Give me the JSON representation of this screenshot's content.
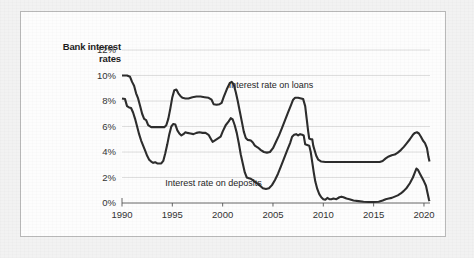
{
  "chart_data": {
    "type": "line",
    "title": "Bank interest rates",
    "title_lines": [
      "Bank interest",
      "rates"
    ],
    "xlabel": "",
    "ylabel": "",
    "xlim": [
      1990,
      2020.6
    ],
    "ylim": [
      0,
      12
    ],
    "grid": true,
    "legend_position": "inline-annotations",
    "x_ticks": [
      "1990",
      "1995",
      "2000",
      "2005",
      "2010",
      "2015",
      "2020"
    ],
    "x_tick_values": [
      1990,
      1995,
      2000,
      2005,
      2010,
      2015,
      2020
    ],
    "y_ticks": [
      "0%",
      "2%",
      "4%",
      "6%",
      "8%",
      "10%",
      "12%"
    ],
    "y_tick_values": [
      0,
      2,
      4,
      6,
      8,
      10,
      12
    ],
    "annotations": [
      {
        "text": "Interest rate on loans",
        "x": 2000.6,
        "y": 9.05
      },
      {
        "text": "Interest rate on deposits",
        "x": 1994.3,
        "y": 1.35
      }
    ],
    "series": [
      {
        "name": "Interest rate on loans",
        "color": "#2d2d2d",
        "points": [
          [
            1990.0,
            10.0
          ],
          [
            1990.5,
            10.0
          ],
          [
            1990.8,
            9.9
          ],
          [
            1991.0,
            9.5
          ],
          [
            1991.2,
            9.2
          ],
          [
            1991.4,
            8.6
          ],
          [
            1991.6,
            8.2
          ],
          [
            1991.8,
            7.6
          ],
          [
            1992.0,
            7.0
          ],
          [
            1992.2,
            6.6
          ],
          [
            1992.4,
            6.5
          ],
          [
            1992.6,
            6.1
          ],
          [
            1992.9,
            5.95
          ],
          [
            1993.4,
            5.95
          ],
          [
            1993.9,
            5.95
          ],
          [
            1994.2,
            5.95
          ],
          [
            1994.4,
            6.1
          ],
          [
            1994.6,
            6.6
          ],
          [
            1994.8,
            7.4
          ],
          [
            1995.0,
            8.3
          ],
          [
            1995.2,
            8.85
          ],
          [
            1995.4,
            8.9
          ],
          [
            1995.6,
            8.6
          ],
          [
            1995.8,
            8.4
          ],
          [
            1996.0,
            8.25
          ],
          [
            1996.3,
            8.2
          ],
          [
            1996.6,
            8.2
          ],
          [
            1997.0,
            8.3
          ],
          [
            1997.4,
            8.35
          ],
          [
            1997.8,
            8.35
          ],
          [
            1998.2,
            8.3
          ],
          [
            1998.6,
            8.25
          ],
          [
            1998.9,
            8.1
          ],
          [
            1999.1,
            7.75
          ],
          [
            1999.4,
            7.7
          ],
          [
            1999.7,
            7.75
          ],
          [
            1999.9,
            7.85
          ],
          [
            2000.1,
            8.3
          ],
          [
            2000.4,
            8.9
          ],
          [
            2000.7,
            9.4
          ],
          [
            2000.9,
            9.5
          ],
          [
            2001.1,
            9.3
          ],
          [
            2001.3,
            8.7
          ],
          [
            2001.5,
            8.0
          ],
          [
            2001.7,
            7.2
          ],
          [
            2001.9,
            6.4
          ],
          [
            2002.1,
            5.6
          ],
          [
            2002.3,
            5.1
          ],
          [
            2002.5,
            4.95
          ],
          [
            2002.8,
            4.9
          ],
          [
            2003.0,
            4.75
          ],
          [
            2003.2,
            4.5
          ],
          [
            2003.5,
            4.35
          ],
          [
            2003.8,
            4.15
          ],
          [
            2004.1,
            4.0
          ],
          [
            2004.4,
            3.95
          ],
          [
            2004.7,
            4.0
          ],
          [
            2005.0,
            4.3
          ],
          [
            2005.3,
            4.8
          ],
          [
            2005.6,
            5.3
          ],
          [
            2005.9,
            5.9
          ],
          [
            2006.2,
            6.5
          ],
          [
            2006.5,
            7.1
          ],
          [
            2006.8,
            7.7
          ],
          [
            2007.0,
            8.1
          ],
          [
            2007.2,
            8.25
          ],
          [
            2007.5,
            8.25
          ],
          [
            2007.8,
            8.2
          ],
          [
            2008.0,
            8.15
          ],
          [
            2008.2,
            7.6
          ],
          [
            2008.35,
            6.6
          ],
          [
            2008.5,
            5.6
          ],
          [
            2008.6,
            5.05
          ],
          [
            2008.75,
            5.0
          ],
          [
            2008.9,
            5.0
          ],
          [
            2009.0,
            4.5
          ],
          [
            2009.15,
            4.1
          ],
          [
            2009.3,
            3.7
          ],
          [
            2009.5,
            3.4
          ],
          [
            2009.8,
            3.25
          ],
          [
            2010.2,
            3.22
          ],
          [
            2011.0,
            3.22
          ],
          [
            2012.0,
            3.22
          ],
          [
            2013.0,
            3.22
          ],
          [
            2014.0,
            3.22
          ],
          [
            2015.0,
            3.22
          ],
          [
            2015.6,
            3.22
          ],
          [
            2015.9,
            3.3
          ],
          [
            2016.2,
            3.5
          ],
          [
            2016.5,
            3.65
          ],
          [
            2016.8,
            3.75
          ],
          [
            2017.1,
            3.8
          ],
          [
            2017.4,
            3.95
          ],
          [
            2017.7,
            4.15
          ],
          [
            2018.0,
            4.4
          ],
          [
            2018.3,
            4.7
          ],
          [
            2018.6,
            5.0
          ],
          [
            2018.9,
            5.35
          ],
          [
            2019.1,
            5.5
          ],
          [
            2019.3,
            5.55
          ],
          [
            2019.5,
            5.45
          ],
          [
            2019.7,
            5.2
          ],
          [
            2019.9,
            4.9
          ],
          [
            2020.1,
            4.7
          ],
          [
            2020.3,
            4.3
          ],
          [
            2020.45,
            3.6
          ],
          [
            2020.55,
            3.25
          ]
        ]
      },
      {
        "name": "Interest rate on deposits",
        "color": "#2d2d2d",
        "points": [
          [
            1990.0,
            8.2
          ],
          [
            1990.3,
            8.15
          ],
          [
            1990.5,
            7.6
          ],
          [
            1990.7,
            7.5
          ],
          [
            1990.9,
            7.45
          ],
          [
            1991.1,
            7.1
          ],
          [
            1991.3,
            6.6
          ],
          [
            1991.5,
            6.0
          ],
          [
            1991.7,
            5.4
          ],
          [
            1991.9,
            4.9
          ],
          [
            1992.1,
            4.5
          ],
          [
            1992.3,
            4.1
          ],
          [
            1992.5,
            3.7
          ],
          [
            1992.7,
            3.4
          ],
          [
            1992.9,
            3.25
          ],
          [
            1993.1,
            3.15
          ],
          [
            1993.3,
            3.2
          ],
          [
            1993.5,
            3.1
          ],
          [
            1993.7,
            3.1
          ],
          [
            1993.9,
            3.1
          ],
          [
            1994.1,
            3.3
          ],
          [
            1994.3,
            3.9
          ],
          [
            1994.5,
            4.6
          ],
          [
            1994.7,
            5.4
          ],
          [
            1994.9,
            6.0
          ],
          [
            1995.1,
            6.2
          ],
          [
            1995.3,
            6.15
          ],
          [
            1995.5,
            5.7
          ],
          [
            1995.7,
            5.45
          ],
          [
            1995.9,
            5.3
          ],
          [
            1996.1,
            5.4
          ],
          [
            1996.3,
            5.55
          ],
          [
            1996.5,
            5.5
          ],
          [
            1996.8,
            5.45
          ],
          [
            1997.1,
            5.4
          ],
          [
            1997.4,
            5.5
          ],
          [
            1997.7,
            5.55
          ],
          [
            1998.0,
            5.5
          ],
          [
            1998.3,
            5.5
          ],
          [
            1998.6,
            5.35
          ],
          [
            1998.85,
            5.0
          ],
          [
            1999.0,
            4.8
          ],
          [
            1999.2,
            4.9
          ],
          [
            1999.5,
            5.05
          ],
          [
            1999.8,
            5.2
          ],
          [
            2000.0,
            5.6
          ],
          [
            2000.3,
            6.1
          ],
          [
            2000.6,
            6.4
          ],
          [
            2000.8,
            6.65
          ],
          [
            2001.0,
            6.55
          ],
          [
            2001.2,
            6.1
          ],
          [
            2001.4,
            5.5
          ],
          [
            2001.6,
            4.7
          ],
          [
            2001.8,
            3.8
          ],
          [
            2002.0,
            3.1
          ],
          [
            2002.2,
            2.4
          ],
          [
            2002.4,
            2.0
          ],
          [
            2002.6,
            1.95
          ],
          [
            2002.8,
            1.9
          ],
          [
            2003.0,
            1.8
          ],
          [
            2003.2,
            1.65
          ],
          [
            2003.5,
            1.5
          ],
          [
            2003.8,
            1.3
          ],
          [
            2004.0,
            1.15
          ],
          [
            2004.3,
            1.1
          ],
          [
            2004.6,
            1.15
          ],
          [
            2004.9,
            1.4
          ],
          [
            2005.2,
            1.8
          ],
          [
            2005.5,
            2.3
          ],
          [
            2005.8,
            2.9
          ],
          [
            2006.1,
            3.5
          ],
          [
            2006.4,
            4.1
          ],
          [
            2006.7,
            4.7
          ],
          [
            2006.9,
            5.2
          ],
          [
            2007.1,
            5.35
          ],
          [
            2007.3,
            5.4
          ],
          [
            2007.5,
            5.3
          ],
          [
            2007.7,
            5.4
          ],
          [
            2007.9,
            5.35
          ],
          [
            2008.05,
            5.3
          ],
          [
            2008.2,
            4.6
          ],
          [
            2008.4,
            4.55
          ],
          [
            2008.6,
            4.5
          ],
          [
            2008.75,
            4.0
          ],
          [
            2008.9,
            3.2
          ],
          [
            2009.05,
            2.4
          ],
          [
            2009.2,
            1.7
          ],
          [
            2009.4,
            1.1
          ],
          [
            2009.6,
            0.7
          ],
          [
            2009.8,
            0.45
          ],
          [
            2010.0,
            0.3
          ],
          [
            2010.2,
            0.25
          ],
          [
            2010.4,
            0.4
          ],
          [
            2010.6,
            0.3
          ],
          [
            2010.8,
            0.3
          ],
          [
            2011.0,
            0.35
          ],
          [
            2011.3,
            0.3
          ],
          [
            2011.6,
            0.45
          ],
          [
            2011.8,
            0.5
          ],
          [
            2012.0,
            0.45
          ],
          [
            2012.3,
            0.35
          ],
          [
            2012.6,
            0.3
          ],
          [
            2013.0,
            0.2
          ],
          [
            2013.5,
            0.15
          ],
          [
            2014.0,
            0.1
          ],
          [
            2014.5,
            0.08
          ],
          [
            2015.0,
            0.08
          ],
          [
            2015.5,
            0.1
          ],
          [
            2015.9,
            0.2
          ],
          [
            2016.2,
            0.3
          ],
          [
            2016.5,
            0.35
          ],
          [
            2016.8,
            0.4
          ],
          [
            2017.1,
            0.5
          ],
          [
            2017.4,
            0.6
          ],
          [
            2017.7,
            0.75
          ],
          [
            2018.0,
            0.95
          ],
          [
            2018.3,
            1.2
          ],
          [
            2018.6,
            1.55
          ],
          [
            2018.9,
            2.0
          ],
          [
            2019.1,
            2.4
          ],
          [
            2019.25,
            2.7
          ],
          [
            2019.4,
            2.6
          ],
          [
            2019.6,
            2.3
          ],
          [
            2019.8,
            2.0
          ],
          [
            2020.0,
            1.7
          ],
          [
            2020.2,
            1.35
          ],
          [
            2020.35,
            0.8
          ],
          [
            2020.5,
            0.25
          ],
          [
            2020.55,
            0.15
          ]
        ]
      }
    ]
  }
}
